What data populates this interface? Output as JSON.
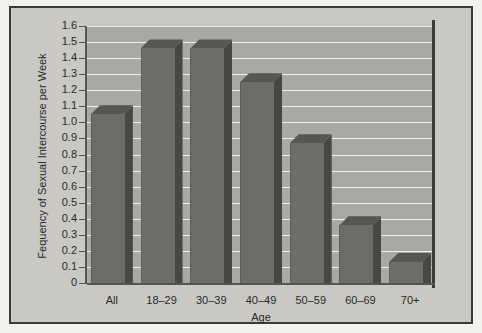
{
  "chart_data": {
    "type": "bar",
    "title": "",
    "subtitle": "",
    "xlabel": "Age",
    "ylabel": "Fequency of Sexual Intercourse per Week",
    "categories": [
      "All",
      "18–29",
      "30–39",
      "40–49",
      "50–59",
      "60–69",
      "70+"
    ],
    "values": [
      1.05,
      1.46,
      1.46,
      1.25,
      0.87,
      0.36,
      0.13
    ],
    "series": [
      {
        "name": "Frequency of Sexual Intercourse per Week",
        "values": [
          1.05,
          1.46,
          1.46,
          1.25,
          0.87,
          0.36,
          0.13
        ]
      }
    ],
    "ylim": [
      0,
      1.6
    ],
    "ytick_labels": [
      "1.6",
      "1.5",
      "1.4",
      "1.3",
      "1.2",
      "1.1",
      "1.0",
      "0.9",
      "0.8",
      "0.7",
      "0.6",
      "0.5",
      "0.4",
      "0.3",
      "0.2",
      "0.1",
      "0"
    ],
    "ytick_values": [
      1.6,
      1.5,
      1.4,
      1.3,
      1.2,
      1.1,
      1.0,
      0.9,
      0.8,
      0.7,
      0.6,
      0.5,
      0.4,
      0.3,
      0.2,
      0.1,
      0
    ],
    "grid": true,
    "grid_axis": "y",
    "legend": false,
    "legend_position": "none",
    "style": "3d-bar",
    "colors": {
      "bar_front": "#6c6c69",
      "bar_side": "#474745",
      "bar_top": "#565653",
      "plot_background": "#a9a8a3",
      "figure_background": "#c9c8c3",
      "gridline": "#f0efe9",
      "axis": "#55544f",
      "border": "#3a3a38",
      "text": "#2a2a28"
    }
  }
}
